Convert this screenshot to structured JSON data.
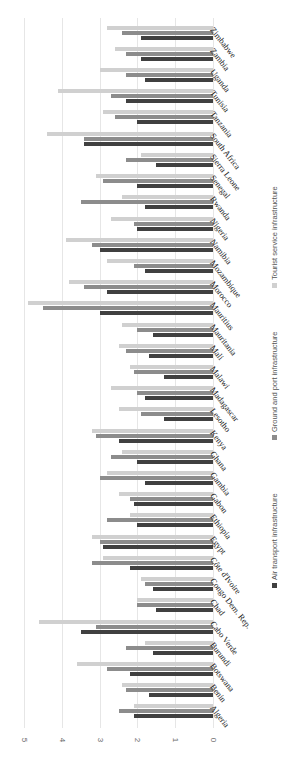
{
  "chart_data": {
    "type": "bar",
    "orientation": "horizontal (figure rotated 90°)",
    "title": "",
    "xlabel": "",
    "ylabel": "",
    "ylim": [
      0,
      5
    ],
    "ticks": [
      "0",
      "1",
      "2",
      "3",
      "4",
      "5"
    ],
    "grid": true,
    "legend_position": "bottom (rotated, right edge)",
    "categories": [
      "Algeria",
      "Benin",
      "Botswana",
      "Burundi",
      "Cabo Verde",
      "Chad",
      "Congo Dem. Rep.",
      "Côte d'Ivoire",
      "Egypt",
      "Ethiopia",
      "Gabon",
      "Gambia",
      "Ghana",
      "Kenya",
      "Lesotho",
      "Madagascar",
      "Malawi",
      "Mali",
      "Mauritania",
      "Mauritius",
      "Morocco",
      "Mozambique",
      "Namibia",
      "Nigeria",
      "Rwanda",
      "Senegal",
      "Sierra Leone",
      "South Africa",
      "Tanzania",
      "Tunisia",
      "Uganda",
      "Zambia",
      "Zimbabwe"
    ],
    "series": [
      {
        "name": "Air transport infrastructure",
        "color": "#404040",
        "values": [
          2.1,
          1.7,
          2.2,
          1.6,
          3.5,
          1.5,
          1.6,
          2.2,
          2.9,
          2.0,
          2.1,
          1.8,
          2.0,
          2.5,
          1.3,
          1.8,
          1.3,
          1.7,
          1.6,
          3.0,
          2.8,
          1.8,
          3.0,
          2.0,
          1.8,
          2.0,
          1.5,
          3.4,
          2.0,
          2.3,
          1.8,
          1.9,
          1.9
        ]
      },
      {
        "name": "Ground and port infrastructure",
        "color": "#8c8c8c",
        "values": [
          2.5,
          2.3,
          2.8,
          2.3,
          3.1,
          2.0,
          1.8,
          3.2,
          3.0,
          2.8,
          2.2,
          3.0,
          2.7,
          3.1,
          1.9,
          2.0,
          2.1,
          2.3,
          2.0,
          4.5,
          3.4,
          2.1,
          3.2,
          2.1,
          3.5,
          2.9,
          2.3,
          3.4,
          2.6,
          2.7,
          2.3,
          2.3,
          2.4
        ]
      },
      {
        "name": "Tourist service infrastructure",
        "color": "#d0d0d0",
        "values": [
          2.1,
          2.4,
          3.6,
          1.8,
          4.6,
          2.0,
          1.9,
          2.9,
          3.2,
          2.2,
          2.5,
          2.8,
          2.4,
          3.2,
          2.5,
          2.7,
          2.2,
          2.5,
          2.4,
          4.9,
          3.8,
          2.8,
          3.9,
          2.7,
          2.4,
          3.1,
          1.9,
          4.4,
          2.9,
          4.1,
          3.0,
          2.6,
          2.8
        ]
      }
    ]
  },
  "legend": {
    "items": [
      {
        "label": "Air transport infrastructure",
        "color": "#404040"
      },
      {
        "label": "Ground and port infrastructure",
        "color": "#8c8c8c"
      },
      {
        "label": "Tourist service infrastructure",
        "color": "#d0d0d0"
      }
    ]
  }
}
